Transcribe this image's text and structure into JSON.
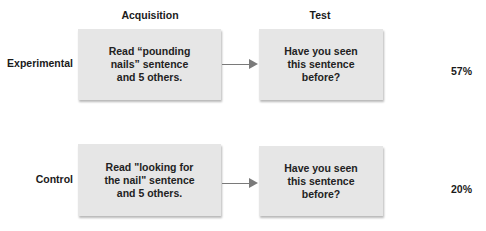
{
  "columns": {
    "acquisition": "Acquisition",
    "test": "Test"
  },
  "rows": [
    {
      "label": "Experimental",
      "acquisition_text": "Read “pounding\nnails” sentence\nand 5 others.",
      "test_text": "Have you seen\nthis sentence\nbefore?",
      "result": "57%"
    },
    {
      "label": "Control",
      "acquisition_text": "Read \"looking for\nthe nail\" sentence\nand 5 others.",
      "test_text": "Have you seen\nthis sentence\nbefore?",
      "result": "20%"
    }
  ],
  "colors": {
    "box_fill": "#e6e6e6",
    "arrow": "#7a7a7a",
    "text": "#1a1a1a"
  }
}
